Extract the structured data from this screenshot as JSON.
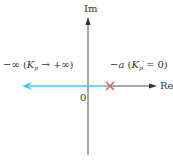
{
  "diagram": {
    "axes": {
      "im_label": "Im",
      "re_label": "Re",
      "origin_label": "0"
    },
    "left_label": {
      "prefix": "−∞",
      "k": "K",
      "sub": "p",
      "rest": " → +∞)"
    },
    "right_label": {
      "prefix": "−a",
      "k": "K",
      "sub": "p",
      "rest": " = 0)"
    },
    "colors": {
      "axis": "#333333",
      "locus": "#45c4ec",
      "pole": "#e8555a"
    }
  }
}
